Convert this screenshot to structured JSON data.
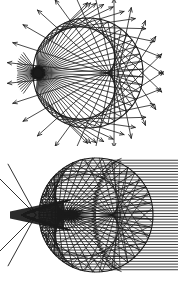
{
  "figure": {
    "title": "",
    "background_color": "#ffffff",
    "ink_color": "#1a1a1a",
    "width": 178,
    "height": 292,
    "panel_count": 2
  },
  "panels": [
    {
      "id": "panel-top",
      "name": "point-source-reflection-diagram",
      "caption": "",
      "description": "Rays from a point source inside a circular mirror, reflecting off the boundary and exiting",
      "viewbox": "0 0 178 146",
      "circle": {
        "cx": 88,
        "cy": 73,
        "r": 55,
        "stroke_width": 1.1
      },
      "source": {
        "x": 38,
        "y": 73,
        "blob_radius": 7
      },
      "ray_count": 46,
      "fan_half_angle_deg": 96,
      "exit_extension": 26,
      "arrowheads": true
    },
    {
      "id": "panel-bottom",
      "name": "parallel-beam-caustic-diagram",
      "caption": "",
      "description": "Parallel horizontal rays entering a circular mirror from the right, reflecting to form a cusp caustic",
      "viewbox": "0 0 178 146",
      "circle": {
        "cx": 96,
        "cy": 69,
        "r": 57,
        "stroke_width": 1.1
      },
      "cusp": {
        "x": 22,
        "y": 69
      },
      "ray_count": 40,
      "incoming_from": "right",
      "incoming_x_start": 178,
      "whisker_count": 4,
      "arrowheads": true
    }
  ],
  "chart_data": {
    "type": "scatter",
    "title": "",
    "xlabel": "",
    "ylabel": "",
    "series": [
      {
        "name": "top-panel-circle-boundary",
        "cx": 88,
        "cy": 73,
        "r": 55
      },
      {
        "name": "top-panel-source-point",
        "x": [
          38
        ],
        "y": [
          73
        ]
      },
      {
        "name": "bottom-panel-circle-boundary",
        "cx": 96,
        "cy": 69,
        "r": 57
      },
      {
        "name": "bottom-panel-caustic-cusp",
        "x": [
          22
        ],
        "y": [
          69
        ]
      }
    ]
  }
}
